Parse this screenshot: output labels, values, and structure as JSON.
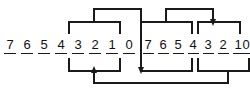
{
  "figure": {
    "type": "bit-field-routing-diagram",
    "line_color": "#1a1a1a",
    "text_color": "#111111",
    "background_color": "#ffffff"
  },
  "groups": [
    {
      "id": "left-field",
      "name": "left-bit-field",
      "digits": [
        "7",
        "6",
        "5",
        "4",
        "3",
        "2",
        "1",
        "0"
      ],
      "x_positions": [
        10,
        27,
        44,
        61,
        78,
        95,
        112,
        129
      ],
      "baseline_y": 49,
      "underline_y": 53,
      "underline_half_width": 6
    },
    {
      "id": "right-field",
      "name": "right-bit-field",
      "digits": [
        "7",
        "6",
        "5",
        "4",
        "3",
        "2",
        "1",
        "0"
      ],
      "x_positions": [
        148,
        165,
        182,
        199,
        216,
        233,
        250,
        267
      ],
      "baseline_y": 49,
      "underline_y": 53,
      "underline_half_width": 6
    }
  ],
  "connectors": [
    {
      "id": "left-top-inner-bracket",
      "name": "left-top-inner-bracket",
      "shape": "bracket-up",
      "span_from_x": 69,
      "span_to_x": 120,
      "stem_x": 94,
      "rail_y": 22,
      "drop_y": 34
    },
    {
      "id": "left-top-outer-run",
      "name": "left-top-outer-run",
      "shape": "up-over-right",
      "from_x": 94,
      "to_x": 141,
      "rail_y": 9,
      "drop_to_y": 73
    },
    {
      "id": "left-bottom-inner-bracket",
      "name": "left-bottom-inner-bracket",
      "shape": "bracket-down",
      "span_from_x": 69,
      "span_to_x": 120,
      "stem_x": 94,
      "rail_y": 71,
      "rise_y": 58
    },
    {
      "id": "left-bottom-feed",
      "name": "left-bottom-feed-line",
      "shape": "from-right-to-arrow-up",
      "from_x": 250,
      "to_x": 94,
      "rail_y": 83,
      "arrow_y": 71
    },
    {
      "id": "right-top-left-bracket",
      "name": "right-top-left-bracket",
      "shape": "bracket-up",
      "span_from_x": 141,
      "span_to_x": 192,
      "stem_x": 166,
      "rail_y": 22,
      "drop_y": 34
    },
    {
      "id": "right-top-cross-run",
      "name": "right-top-cross-run",
      "shape": "up-over-right-arrow-down",
      "from_x": 166,
      "to_x": 213,
      "rail_y": 9,
      "arrow_y": 22
    },
    {
      "id": "right-top-right-bracket",
      "name": "right-top-right-bracket",
      "shape": "bracket-up",
      "span_from_x": 198,
      "span_to_x": 240,
      "stem_x": 213,
      "rail_y": 22,
      "drop_y": 34
    },
    {
      "id": "right-bottom-left-bracket",
      "name": "right-bottom-left-bracket",
      "shape": "bracket-down",
      "span_from_x": 141,
      "span_to_x": 192,
      "stem_x": 166,
      "rail_y": 71,
      "rise_y": 58
    },
    {
      "id": "right-bottom-right-bracket",
      "name": "right-bottom-right-bracket",
      "shape": "bracket-down",
      "span_from_x": 198,
      "span_to_x": 240,
      "stem_x": 219,
      "rail_y": 71,
      "rise_y": 58
    }
  ],
  "arrows": [
    {
      "id": "arrow-up-left-field",
      "name": "arrow-up-into-left-field",
      "direction": "up",
      "x": 94,
      "y": 69
    },
    {
      "id": "arrow-right-into-right-field",
      "name": "arrow-down-into-right-bottom-left-bracket",
      "direction": "down",
      "x": 141,
      "y": 71
    },
    {
      "id": "arrow-down-right-top",
      "name": "arrow-down-into-right-top-right-bracket",
      "direction": "down",
      "x": 213,
      "y": 22
    }
  ]
}
